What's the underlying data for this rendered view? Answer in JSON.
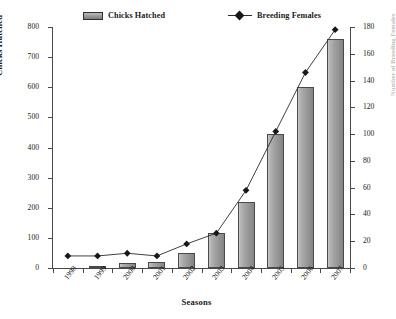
{
  "chart_data": {
    "type": "bar",
    "title": "",
    "subtitle": "",
    "categories": [
      "1998",
      "1999",
      "2000",
      "2001",
      "2002",
      "2003",
      "2004",
      "2005",
      "2006",
      "2007"
    ],
    "xlabel": "Seasons",
    "ylabel": "Chicks Hatched",
    "y2label": "Number of Breeding Females",
    "ylim": [
      0,
      800
    ],
    "y2lim": [
      0,
      180
    ],
    "yticks": [
      0,
      100,
      200,
      300,
      400,
      500,
      600,
      700,
      800
    ],
    "y2ticks": [
      0,
      20,
      40,
      60,
      80,
      100,
      120,
      140,
      160,
      180
    ],
    "grid": false,
    "legend_position": "top",
    "series": [
      {
        "name": "Chicks Hatched",
        "kind": "bar",
        "axis": "left",
        "color": "#a2a2a2",
        "values": [
          0,
          3,
          15,
          20,
          50,
          115,
          220,
          445,
          600,
          760
        ]
      },
      {
        "name": "Breeding Females",
        "kind": "line",
        "axis": "right",
        "marker": "diamond",
        "color": "#181818",
        "values": [
          9,
          9,
          11,
          9,
          18,
          26,
          58,
          102,
          146,
          178
        ]
      }
    ]
  },
  "legend": {
    "bars_label": "Chicks Hatched",
    "line_label": "Breeding Females"
  },
  "axes": {
    "left_title": "Chicks Hatched",
    "right_title": "Number of Breeding Females",
    "bottom_title": "Seasons",
    "left_ticks": [
      "800",
      "700",
      "600",
      "500",
      "400",
      "300",
      "200",
      "100",
      "0"
    ],
    "right_ticks": [
      "180",
      "160",
      "140",
      "120",
      "100",
      "80",
      "60",
      "40",
      "20",
      "0"
    ],
    "x_ticks": [
      "1998",
      "1999",
      "2000",
      "2001",
      "2002",
      "2003",
      "2004",
      "2005",
      "2006",
      "2007"
    ]
  }
}
